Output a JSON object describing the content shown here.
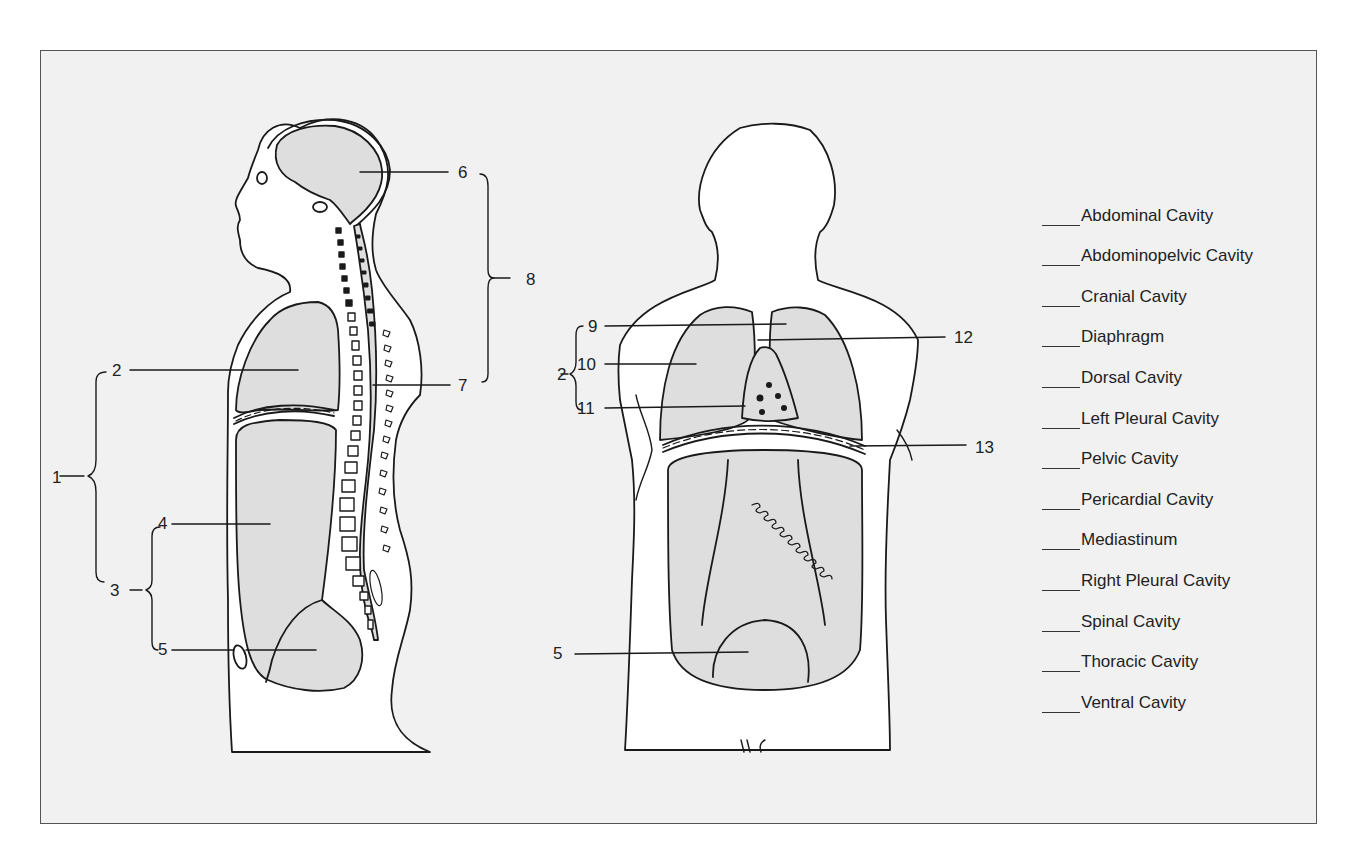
{
  "figure": {
    "callouts": [
      {
        "num": "1",
        "x": 52,
        "y": 470
      },
      {
        "num": "2",
        "x": 112,
        "y": 363
      },
      {
        "num": "3",
        "x": 110,
        "y": 583
      },
      {
        "num": "4",
        "x": 158,
        "y": 516
      },
      {
        "num": "5",
        "x": 158,
        "y": 640
      },
      {
        "num": "6",
        "x": 458,
        "y": 165
      },
      {
        "num": "7",
        "x": 458,
        "y": 378
      },
      {
        "num": "8",
        "x": 526,
        "y": 272
      },
      {
        "num": "2",
        "x": 557,
        "y": 365
      },
      {
        "num": "9",
        "x": 588,
        "y": 319
      },
      {
        "num": "10",
        "x": 577,
        "y": 357
      },
      {
        "num": "11",
        "x": 577,
        "y": 401
      },
      {
        "num": "12",
        "x": 954,
        "y": 330
      },
      {
        "num": "13",
        "x": 975,
        "y": 440
      },
      {
        "num": "5",
        "x": 553,
        "y": 654
      }
    ],
    "left_figure": "sagittal-section-body",
    "right_figure": "frontal-section-body"
  },
  "word_bank": {
    "items": [
      "Abdominal Cavity",
      "Abdominopelvic Cavity",
      "Cranial Cavity",
      "Diaphragm",
      "Dorsal Cavity",
      "Left Pleural Cavity",
      "Pelvic Cavity",
      "Pericardial Cavity",
      "Mediastinum",
      "Right Pleural Cavity",
      "Spinal Cavity",
      "Thoracic Cavity",
      "Ventral Cavity"
    ]
  },
  "colors": {
    "background": "#f1f1f1",
    "cavity_fill": "#dedede",
    "body_fill": "#ffffff",
    "line": "#1a1a1a"
  }
}
